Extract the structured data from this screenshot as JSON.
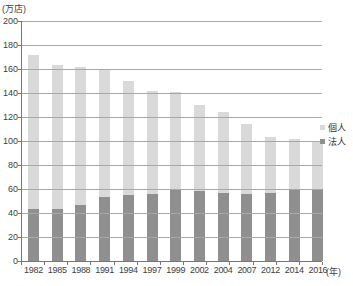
{
  "chart_data": {
    "type": "bar",
    "subtype": "stacked-vertical",
    "title": "",
    "unit_label": "(万店)",
    "axis_unit_label": "(年)",
    "categories": [
      "1982",
      "1985",
      "1988",
      "1991",
      "1994",
      "1997",
      "1999",
      "2002",
      "2004",
      "2007",
      "2012",
      "2014",
      "2016"
    ],
    "series": [
      {
        "name": "法人",
        "color": "#8f8f8f",
        "values": [
          43,
          43,
          47,
          53,
          55,
          56,
          59,
          58,
          57,
          56,
          57,
          60,
          60
        ]
      },
      {
        "name": "個人",
        "color": "#d9d9d9",
        "values": [
          129,
          120,
          115,
          106,
          95,
          86,
          82,
          72,
          67,
          58,
          46,
          42,
          39
        ]
      }
    ],
    "totals": [
      172,
      163,
      162,
      159,
      150,
      142,
      141,
      130,
      124,
      114,
      103,
      102,
      99
    ],
    "stack_order_bottom_to_top": [
      "法人",
      "個人"
    ],
    "legend_order_top_to_bottom": [
      "個人",
      "法人"
    ],
    "legend_position": "right",
    "grid": true,
    "gridline_color": "#a8a8a8",
    "axis_color": "#767676",
    "ylim": [
      0,
      200
    ],
    "ytick_step": 20,
    "yticks": [
      0,
      20,
      40,
      60,
      80,
      100,
      120,
      140,
      160,
      180,
      200
    ]
  }
}
